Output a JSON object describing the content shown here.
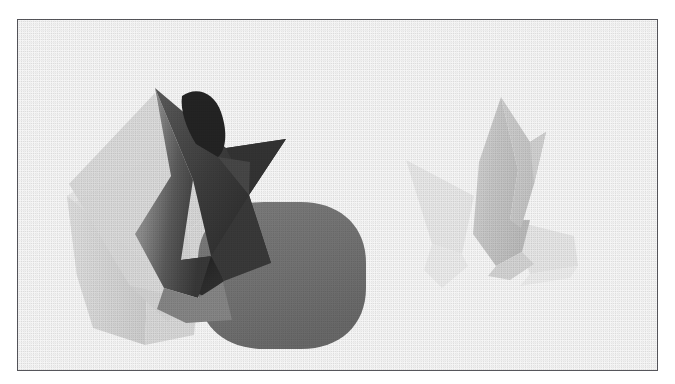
{
  "figure": {
    "kind": "scanned-figure-plate",
    "caption": "",
    "border_color": "#4a4a50",
    "background_color": "#ffffff",
    "frame": {
      "x": 17,
      "y": 19,
      "width": 641,
      "height": 352
    }
  },
  "palette": {
    "star_front_light": "#9b9b9b",
    "star_front_mid": "#7d7d7d",
    "star_front_dark": "#3d3d3d",
    "star_inner_shadow": "#2a2a2a",
    "star_cavity_black": "#242424",
    "rounded_box": "#7a7a7a",
    "rounded_box_shade": "#6e6e6e",
    "hex_prism_light": "#e4e4e4",
    "hex_prism_face": "#dcdcdc",
    "hex_prism_edge": "#cfcfcf",
    "ghost_star_body": "#cbcbcb",
    "ghost_star_light": "#e6e6e6",
    "ghost_star_faint": "#f0f0f0",
    "paper_white": "#ffffff"
  },
  "renderings": [
    {
      "id": "left-solid-csg",
      "label": "solid CSG star intersecting rounded box",
      "position": "left",
      "objects": [
        {
          "name": "star-prism",
          "shading": "gradient-dark",
          "role": "primary"
        },
        {
          "name": "rounded-box",
          "shading": "flat-mid-gray",
          "role": "secondary"
        },
        {
          "name": "hexagonal-prism",
          "shading": "flat-light-gray",
          "role": "background"
        },
        {
          "name": "star-cavity",
          "shading": "near-black",
          "role": "interior"
        }
      ]
    },
    {
      "id": "right-ghost-csg",
      "label": "faded translucent star prism",
      "position": "right",
      "objects": [
        {
          "name": "ghost-star-prism",
          "shading": "gradient-light",
          "role": "primary"
        },
        {
          "name": "ghost-star-wing",
          "shading": "near-white",
          "role": "secondary"
        }
      ]
    }
  ]
}
